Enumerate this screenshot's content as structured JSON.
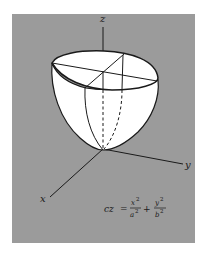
{
  "figure": {
    "background_color": "#9b9b9b",
    "surface_color": "#ffffff",
    "line_color": "#1a1a1a",
    "axes": {
      "z_label": "z",
      "y_label": "y",
      "x_label": "x"
    },
    "equation": {
      "lhs": "cz",
      "equals": "=",
      "term1_num": "x",
      "term1_num_exp": "2",
      "term1_den": "a",
      "term1_den_exp": "2",
      "plus": "+",
      "term2_num": "y",
      "term2_num_exp": "2",
      "term2_den": "b",
      "term2_den_exp": "2"
    }
  }
}
